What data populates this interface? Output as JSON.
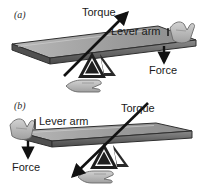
{
  "figure": {
    "background_color": "#ffffff",
    "bar_color": "#6e6e6e",
    "bar_top_color": "#a8a8a8",
    "bar_edge_color": "#3a3a3a",
    "fulcrum_color": "#1c1c1c",
    "hand_color": "#b5b5b5",
    "arrow_color": "#111111",
    "text_color": "#1a1a1a"
  },
  "panels": [
    {
      "id": "a",
      "label": "(a)",
      "annotations": {
        "torque": "Torque",
        "lever_arm": "Lever arm",
        "force": "Force"
      },
      "arrows": {
        "torque_direction": "up-right",
        "force_direction": "down"
      },
      "fulcrum_position": "left-of-center",
      "hand_position": "right-end",
      "bar_tilt": "up-to-the-right"
    },
    {
      "id": "b",
      "label": "(b)",
      "annotations": {
        "torque": "Torque",
        "lever_arm": "Lever arm",
        "force": "Force"
      },
      "arrows": {
        "torque_direction": "down-left",
        "force_direction": "down"
      },
      "fulcrum_position": "right-of-center",
      "hand_position": "left-end",
      "bar_tilt": "up-to-the-right"
    }
  ]
}
